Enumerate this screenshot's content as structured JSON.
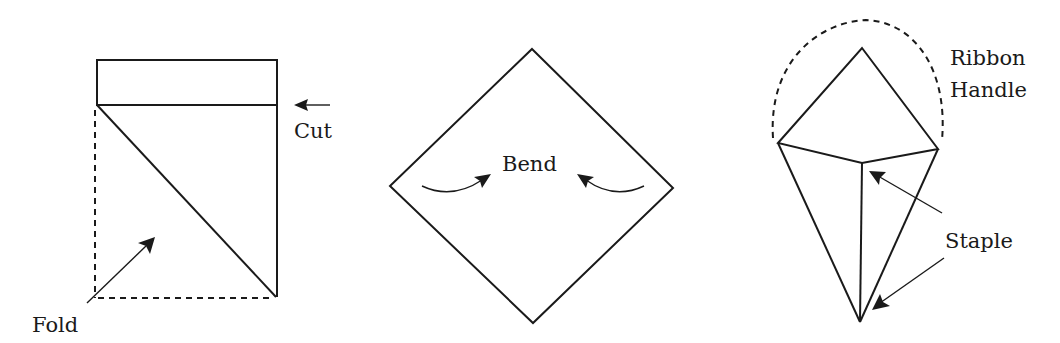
{
  "figures": [
    {
      "name": "fold-and-cut-step",
      "labels": {
        "cut": "Cut",
        "fold": "Fold"
      }
    },
    {
      "name": "bend-step",
      "labels": {
        "bend": "Bend"
      }
    },
    {
      "name": "staple-and-handle-step",
      "labels": {
        "ribbon_line1": "Ribbon",
        "ribbon_line2": "Handle",
        "staple": "Staple"
      }
    }
  ],
  "colors": {
    "stroke": "#1a1a1a",
    "background": "#ffffff"
  }
}
